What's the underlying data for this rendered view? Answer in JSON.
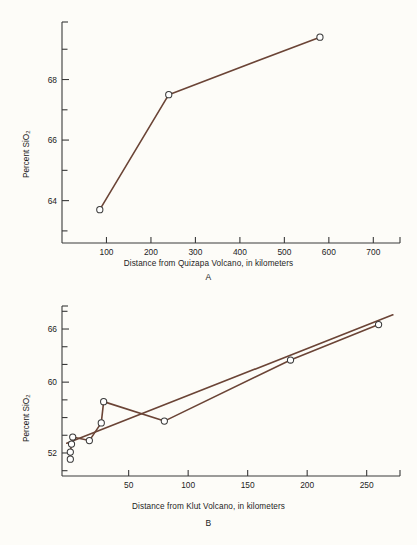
{
  "figure": {
    "background": "#fdfcf8",
    "line_color": "#6b4436",
    "axis_color": "#3a3a3a",
    "marker_fill": "#ffffff",
    "marker_edge": "#3a3a3a"
  },
  "panels": [
    {
      "id": "A",
      "label": "A",
      "ylabel_prefix": "Percent SiO",
      "ylabel_sub": "2",
      "xlabel": "Distance from Quizapa Volcano, in kilometers",
      "x_ticks": [
        100,
        200,
        300,
        400,
        500,
        600,
        700
      ],
      "x_tick_labels": [
        "100",
        "200",
        "300",
        "400",
        "500",
        "600",
        "700"
      ],
      "y_ticks": [
        64,
        66,
        68
      ],
      "y_tick_labels": [
        "64",
        "66",
        "68"
      ],
      "y_minor_ticks": [
        63,
        65,
        67,
        69
      ],
      "xlim": [
        0,
        760
      ],
      "ylim": [
        62.6,
        69.9
      ],
      "chart_type": "line"
    },
    {
      "id": "B",
      "label": "B",
      "ylabel_prefix": "Percent SiO",
      "ylabel_sub": "2",
      "xlabel": "Distance from Klut Volcano, in kilometers",
      "x_ticks": [
        50,
        100,
        150,
        200,
        250
      ],
      "x_tick_labels": [
        "50",
        "100",
        "150",
        "200",
        "250"
      ],
      "y_ticks": [
        52,
        60,
        66
      ],
      "y_tick_labels": [
        "52",
        "60",
        "66"
      ],
      "y_minor_ticks": [
        50,
        54,
        56,
        58,
        62,
        64,
        68
      ],
      "xlim": [
        -6,
        278
      ],
      "ylim": [
        49.4,
        68.6
      ],
      "chart_type": "scatter"
    }
  ],
  "chart_data": [
    {
      "type": "line",
      "title": "",
      "xlabel": "Distance from Quizapa Volcano, in kilometers",
      "ylabel": "Percent SiO2",
      "panel": "A",
      "xlim": [
        0,
        760
      ],
      "ylim": [
        62.6,
        69.9
      ],
      "grid": false,
      "legend": "none",
      "x": [
        85,
        240,
        580
      ],
      "y": [
        63.7,
        67.5,
        69.4
      ],
      "markers": "open-circle",
      "series": [
        {
          "name": "Quizapa Volcano silica trend",
          "points": [
            {
              "x": 85,
              "y": 63.7
            },
            {
              "x": 240,
              "y": 67.5
            },
            {
              "x": 580,
              "y": 69.4
            }
          ]
        }
      ]
    },
    {
      "type": "scatter",
      "title": "",
      "xlabel": "Distance from Klut Volcano, in kilometers",
      "ylabel": "Percent SiO2",
      "panel": "B",
      "xlim": [
        -6,
        278
      ],
      "ylim": [
        49.4,
        68.6
      ],
      "grid": false,
      "legend": "none",
      "markers": "open-circle",
      "x": [
        1,
        1,
        2,
        3,
        17,
        27,
        29,
        80,
        186,
        260
      ],
      "y": [
        51.3,
        52.1,
        53.0,
        53.8,
        53.4,
        55.4,
        57.8,
        55.6,
        62.5,
        66.5
      ],
      "series": [
        {
          "name": "Klut Volcano samples",
          "points": [
            {
              "x": 1,
              "y": 51.3
            },
            {
              "x": 1,
              "y": 52.1
            },
            {
              "x": 2,
              "y": 53.0
            },
            {
              "x": 3,
              "y": 53.8
            },
            {
              "x": 17,
              "y": 53.4
            },
            {
              "x": 27,
              "y": 55.4
            },
            {
              "x": 29,
              "y": 57.8
            },
            {
              "x": 80,
              "y": 55.6
            },
            {
              "x": 186,
              "y": 62.5
            },
            {
              "x": 260,
              "y": 66.5
            }
          ]
        },
        {
          "name": "regression line",
          "type": "trendline",
          "points": [
            {
              "x": -2,
              "y": 53.1
            },
            {
              "x": 272,
              "y": 67.6
            }
          ]
        }
      ]
    }
  ]
}
